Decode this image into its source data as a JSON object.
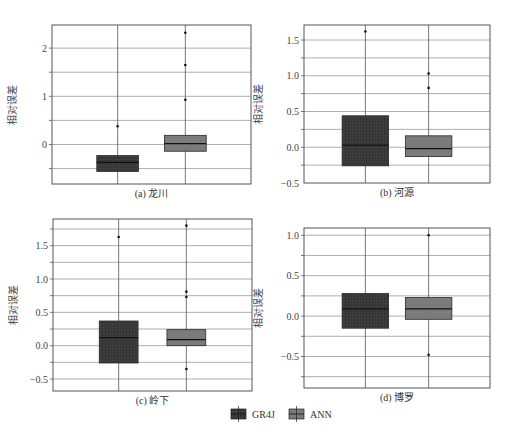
{
  "figure": {
    "legend": [
      {
        "name": "GR4J",
        "color": "#3a3a3a",
        "hatch": true
      },
      {
        "name": "ANN",
        "color": "#7b7b7b",
        "hatch": false
      }
    ],
    "colors": {
      "frame": "#555555",
      "grid": "#9a9a9a",
      "whisker": "#555555",
      "median": "#111111"
    },
    "caption_faint": ""
  },
  "chart_data": [
    {
      "type": "box",
      "title": "(a) 龙川",
      "ylabel": "相对误差",
      "ylim": [
        -0.82,
        2.48
      ],
      "yticks": [
        -0.5,
        0,
        0.5,
        1,
        1.5,
        2
      ],
      "yticklabels": [
        "",
        "0",
        "",
        "1",
        "",
        "2"
      ],
      "layout": {
        "x": 52,
        "y": 25,
        "w": 199,
        "h": 159,
        "pos": [
          0.33,
          0.67
        ],
        "width": 0.42
      },
      "series": [
        {
          "name": "GR4J",
          "q1": -0.56,
          "median": -0.37,
          "q3": -0.23,
          "whislo": -0.82,
          "whishi": 0.1,
          "fliers": [
            0.38
          ]
        },
        {
          "name": "ANN",
          "q1": -0.14,
          "median": 0.02,
          "q3": 0.19,
          "whislo": -0.82,
          "whishi": 0.65,
          "fliers": [
            0.93,
            1.65,
            2.32
          ]
        }
      ]
    },
    {
      "type": "box",
      "title": "(b) 河源",
      "ylabel": "相对误差",
      "ylim": [
        -0.5,
        1.71
      ],
      "yticks": [
        -0.5,
        -0.25,
        0,
        0.25,
        0.5,
        0.75,
        1.0,
        1.25,
        1.5
      ],
      "yticklabels": [
        "−0.5",
        "",
        "0.0",
        "",
        "0.5",
        "",
        "1.0",
        "",
        "1.5"
      ],
      "layout": {
        "x": 304,
        "y": 25,
        "w": 186,
        "h": 158,
        "pos": [
          0.33,
          0.67
        ],
        "width": 0.5
      },
      "series": [
        {
          "name": "GR4J",
          "q1": -0.26,
          "median": 0.03,
          "q3": 0.44,
          "whislo": -0.5,
          "whishi": 1.0,
          "fliers": [
            1.62
          ]
        },
        {
          "name": "ANN",
          "q1": -0.13,
          "median": -0.02,
          "q3": 0.16,
          "whislo": -0.5,
          "whishi": 0.6,
          "fliers": [
            0.83,
            1.03
          ]
        }
      ]
    },
    {
      "type": "box",
      "title": "(c) 岭下",
      "ylabel": "相对误差",
      "ylim": [
        -0.68,
        1.9
      ],
      "yticks": [
        -0.5,
        -0.25,
        0,
        0.25,
        0.5,
        0.75,
        1.0,
        1.25,
        1.5,
        1.75
      ],
      "yticklabels": [
        "−0.5",
        "",
        "0.0",
        "",
        "0.5",
        "",
        "1.0",
        "",
        "1.5",
        ""
      ],
      "layout": {
        "x": 53,
        "y": 219,
        "w": 199,
        "h": 172,
        "pos": [
          0.33,
          0.67
        ],
        "width": 0.39
      },
      "series": [
        {
          "name": "GR4J",
          "q1": -0.26,
          "median": 0.12,
          "q3": 0.37,
          "whislo": -0.68,
          "whishi": 0.7,
          "fliers": [
            1.63
          ]
        },
        {
          "name": "ANN",
          "q1": 0.0,
          "median": 0.09,
          "q3": 0.24,
          "whislo": -0.22,
          "whishi": 0.45,
          "fliers": [
            0.73,
            0.81,
            1.8,
            -0.35
          ]
        }
      ]
    },
    {
      "type": "box",
      "title": "(d) 博罗",
      "ylabel": "相对误差",
      "ylim": [
        -0.89,
        1.09
      ],
      "yticks": [
        -0.75,
        -0.5,
        -0.25,
        0,
        0.25,
        0.5,
        0.75,
        1.0
      ],
      "yticklabels": [
        "",
        "−0.5",
        "",
        "0.0",
        "",
        "0.5",
        "",
        "1.0"
      ],
      "layout": {
        "x": 304,
        "y": 228,
        "w": 186,
        "h": 160,
        "pos": [
          0.33,
          0.67
        ],
        "width": 0.5
      },
      "series": [
        {
          "name": "GR4J",
          "q1": -0.15,
          "median": 0.09,
          "q3": 0.28,
          "whislo": -0.89,
          "whishi": 0.64,
          "fliers": []
        },
        {
          "name": "ANN",
          "q1": -0.04,
          "median": 0.09,
          "q3": 0.23,
          "whislo": -0.35,
          "whishi": 0.45,
          "fliers": [
            1.0,
            -0.48
          ]
        }
      ]
    }
  ]
}
